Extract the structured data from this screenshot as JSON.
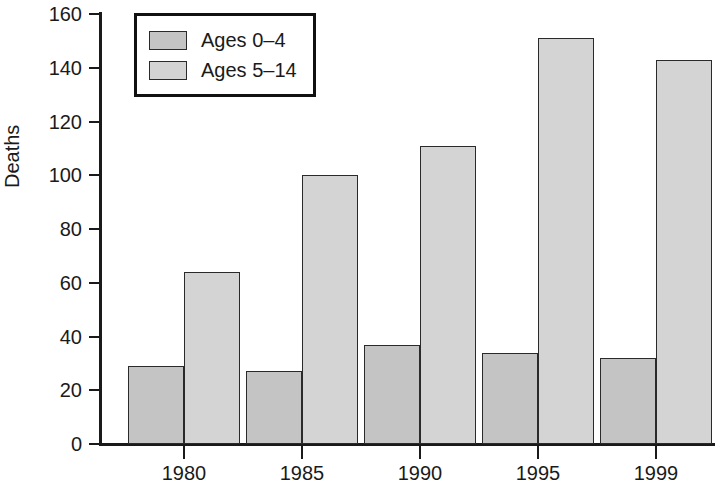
{
  "chart_data": {
    "type": "bar",
    "title": "",
    "subtitle": "",
    "xlabel": "",
    "ylabel": "Deaths",
    "categories": [
      "1980",
      "1985",
      "1990",
      "1995",
      "1999"
    ],
    "series": [
      {
        "name": "Ages 0–4",
        "values": [
          29,
          27,
          37,
          34,
          32
        ],
        "color": "#c4c4c4"
      },
      {
        "name": "Ages 5–14",
        "values": [
          64,
          100,
          111,
          151,
          143
        ],
        "color": "#d4d4d4"
      }
    ],
    "ylim": [
      0,
      160
    ],
    "ytick_values": [
      0,
      20,
      40,
      60,
      80,
      100,
      120,
      140,
      160
    ],
    "ytick_labels": [
      "0",
      "20",
      "40",
      "60",
      "80",
      "100",
      "120",
      "140",
      "160"
    ],
    "grid": false,
    "legend_position": "upper-left-inside",
    "axis_color": "#1a1a1a",
    "background": "#ffffff"
  },
  "legend": {
    "entries": [
      {
        "label": "Ages 0–4"
      },
      {
        "label": "Ages 5–14"
      }
    ]
  },
  "axes": {
    "y_title": "Deaths"
  }
}
